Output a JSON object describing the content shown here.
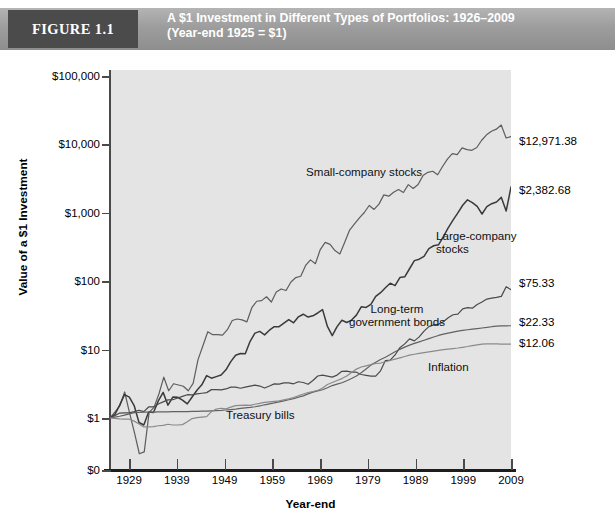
{
  "header": {
    "figure_badge": "FIGURE 1.1",
    "title_line_1": "A $1 Investment in Different Types of Portfolios: 1926–2009",
    "title_line_2": "(Year-end 1925 = $1)"
  },
  "chart_data": {
    "type": "line",
    "title": "A $1 Investment in Different Types of Portfolios: 1926–2009 (Year-end 1925 = $1)",
    "xlabel": "Year-end",
    "ylabel": "Value of a $1 Investment",
    "yscale": "log",
    "xlim": [
      1925,
      2009
    ],
    "ylim_labels": [
      "$0",
      "$1",
      "$10",
      "$100",
      "$1,000",
      "$10,000",
      "$100,000"
    ],
    "y_tick_values": [
      0,
      1,
      10,
      100,
      1000,
      10000,
      100000
    ],
    "x_ticks": [
      1929,
      1939,
      1949,
      1959,
      1969,
      1979,
      1989,
      1999,
      2009
    ],
    "grid": false,
    "legend_position": "inline-annotations",
    "series": [
      {
        "name": "Small-company stocks",
        "end_value_label": "$12,971.38",
        "end_value": 12971.38,
        "color": "#5d5d5d",
        "annotation": "Small-company stocks",
        "values": [
          1.0,
          1.22,
          1.5,
          2.4,
          1.19,
          0.61,
          0.3,
          0.32,
          1.21,
          1.43,
          2.24,
          3.95,
          2.5,
          3.17,
          3.04,
          2.91,
          2.5,
          3.21,
          7.14,
          11.36,
          18.25,
          16.52,
          16.57,
          16.29,
          19.53,
          26.6,
          28.0,
          27.2,
          25.48,
          41.0,
          50.9,
          52.0,
          59.2,
          49.6,
          69.5,
          77.0,
          73.0,
          97.5,
          113.0,
          118.0,
          170.0,
          205.0,
          180.0,
          290.0,
          370.0,
          345.0,
          280.0,
          250.0,
          370.0,
          560.0,
          690.0,
          845.0,
          1010.0,
          1280.0,
          1120.0,
          1340.0,
          1830.0,
          1750.0,
          2000.0,
          2190.0,
          1980.0,
          2580.0,
          2270.0,
          2600.0,
          3500.0,
          3900.0,
          4050.0,
          3600.0,
          4750.0,
          6100.0,
          7350.0,
          7100.0,
          8900.0,
          8400.0,
          8200.0,
          9000.0,
          11500.0,
          13800.0,
          15600.0,
          16700.0,
          19200.0,
          12400.0,
          12971.38
        ]
      },
      {
        "name": "Large-company stocks",
        "end_value_label": "$2,382.68",
        "end_value": 2382.68,
        "color": "#3a3a3a",
        "annotation": "Large-company stocks",
        "values": [
          1.0,
          1.12,
          1.54,
          2.2,
          2.02,
          1.52,
          0.86,
          0.79,
          1.22,
          1.2,
          1.78,
          2.37,
          1.54,
          2.02,
          2.01,
          1.83,
          1.61,
          2.03,
          2.55,
          3.05,
          4.16,
          3.82,
          4.03,
          4.25,
          5.06,
          6.66,
          8.25,
          8.77,
          8.68,
          13.24,
          17.41,
          18.45,
          16.43,
          19.21,
          21.65,
          21.65,
          24.37,
          27.35,
          24.64,
          30.16,
          32.9,
          29.92,
          31.2,
          34.3,
          38.4,
          21.8,
          16.0,
          21.7,
          26.9,
          24.9,
          27.0,
          31.9,
          42.2,
          41.4,
          45.9,
          60.0,
          68.0,
          80.0,
          93.5,
          86.0,
          113.0,
          116.0,
          152.0,
          200.0,
          210.0,
          231.0,
          300.0,
          330.0,
          340.0,
          449.0,
          600.0,
          780.0,
          1000.0,
          1290.0,
          1550.0,
          1410.0,
          1240.0,
          960.0,
          1230.0,
          1360.0,
          1440.0,
          1680.0,
          1060.0,
          2382.68
        ]
      },
      {
        "name": "Long-term government bonds",
        "end_value_label": "$75.33",
        "end_value": 75.33,
        "color": "#4a4a4a",
        "annotation": "Long-term government bonds",
        "values": [
          1.0,
          1.08,
          1.18,
          1.19,
          1.19,
          1.24,
          1.3,
          1.24,
          1.45,
          1.45,
          1.6,
          1.72,
          1.84,
          1.85,
          1.96,
          2.07,
          2.19,
          2.18,
          2.25,
          2.3,
          2.35,
          2.6,
          2.6,
          2.57,
          2.66,
          2.83,
          2.83,
          2.72,
          2.82,
          2.92,
          3.03,
          2.93,
          2.74,
          2.93,
          3.15,
          3.13,
          3.26,
          3.26,
          3.16,
          3.39,
          3.3,
          3.11,
          3.53,
          4.11,
          4.23,
          4.1,
          3.96,
          4.24,
          4.82,
          4.85,
          4.69,
          4.67,
          4.32,
          4.21,
          4.1,
          4.09,
          4.89,
          6.92,
          7.0,
          8.35,
          10.66,
          12.12,
          14.34,
          13.4,
          15.33,
          18.63,
          21.7,
          23.0,
          23.6,
          25.6,
          29.2,
          32.3,
          33.0,
          39.5,
          41.0,
          40.3,
          45.7,
          49.8,
          54.8,
          56.6,
          58.0,
          60.0,
          83.0,
          75.33
        ]
      },
      {
        "name": "Treasury bills",
        "end_value_label": "$22.33",
        "end_value": 22.33,
        "color": "#616161",
        "annotation": "Treasury bills",
        "values": [
          1.0,
          1.03,
          1.06,
          1.1,
          1.15,
          1.2,
          1.21,
          1.22,
          1.22,
          1.22,
          1.23,
          1.23,
          1.23,
          1.24,
          1.24,
          1.24,
          1.24,
          1.25,
          1.25,
          1.26,
          1.26,
          1.27,
          1.28,
          1.29,
          1.31,
          1.33,
          1.35,
          1.38,
          1.41,
          1.43,
          1.46,
          1.5,
          1.56,
          1.61,
          1.66,
          1.72,
          1.78,
          1.85,
          1.92,
          2.01,
          2.11,
          2.25,
          2.39,
          2.49,
          2.59,
          2.77,
          2.98,
          3.13,
          3.28,
          3.51,
          3.79,
          4.12,
          4.58,
          5.2,
          5.93,
          6.55,
          7.15,
          7.73,
          8.47,
          9.29,
          10.09,
          10.87,
          11.63,
          12.33,
          12.99,
          13.7,
          14.5,
          15.3,
          16.1,
          16.8,
          17.4,
          18.0,
          18.6,
          19.1,
          19.5,
          19.9,
          20.3,
          20.7,
          21.1,
          21.6,
          22.0,
          22.25,
          22.3,
          22.33
        ]
      },
      {
        "name": "Inflation",
        "end_value_label": "$12.06",
        "end_value": 12.06,
        "color": "#8a8a8a",
        "annotation": "Inflation",
        "values": [
          1.0,
          0.99,
          0.97,
          0.96,
          0.96,
          0.9,
          0.82,
          0.74,
          0.74,
          0.75,
          0.77,
          0.78,
          0.81,
          0.79,
          0.79,
          0.8,
          0.88,
          0.98,
          1.01,
          1.03,
          1.05,
          1.24,
          1.35,
          1.39,
          1.36,
          1.44,
          1.52,
          1.53,
          1.54,
          1.53,
          1.59,
          1.64,
          1.69,
          1.72,
          1.75,
          1.78,
          1.84,
          1.9,
          1.99,
          2.11,
          2.24,
          2.36,
          2.44,
          2.53,
          2.75,
          3.09,
          3.3,
          3.53,
          3.77,
          4.11,
          4.61,
          5.19,
          5.57,
          5.79,
          6.03,
          6.29,
          6.36,
          6.64,
          6.93,
          7.25,
          7.57,
          7.92,
          8.3,
          8.55,
          8.79,
          9.03,
          9.27,
          9.51,
          9.75,
          9.98,
          10.18,
          10.35,
          10.55,
          10.81,
          11.09,
          11.42,
          11.75,
          12.05,
          12.16,
          12.09,
          12.1,
          12.06,
          12.06,
          12.06
        ]
      }
    ]
  },
  "axes": {
    "y_labels": [
      {
        "text": "$100,000",
        "value": 100000
      },
      {
        "text": "$10,000",
        "value": 10000
      },
      {
        "text": "$1,000",
        "value": 1000
      },
      {
        "text": "$100",
        "value": 100
      },
      {
        "text": "$10",
        "value": 10
      },
      {
        "text": "$1",
        "value": 1
      },
      {
        "text": "$0",
        "value": 0
      }
    ],
    "x_labels": [
      "1929",
      "1939",
      "1949",
      "1959",
      "1969",
      "1979",
      "1989",
      "1999",
      "2009"
    ],
    "y_axis_title": "Value of a $1 Investment",
    "x_axis_title": "Year-end"
  },
  "colors": {
    "header_bar": "#9d9d9d",
    "badge": "#4b4b4b",
    "plot_background": "#e4e4e4",
    "axis": "#4a4a4a"
  }
}
